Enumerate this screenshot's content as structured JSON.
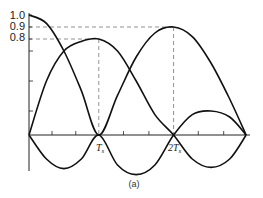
{
  "chart_data": {
    "type": "line",
    "title": "",
    "caption": "(a)",
    "xlabel": "",
    "ylabel": "",
    "xlim": [
      0,
      2.97
    ],
    "ylim": [
      -0.35,
      1.0
    ],
    "y_tick_labels": [
      {
        "value": 1.0,
        "label": "1.0"
      },
      {
        "value": 0.9,
        "label": "0.9"
      },
      {
        "value": 0.8,
        "label": "0.8"
      }
    ],
    "y_minor_ticks": [
      0.7,
      0.45,
      0.2
    ],
    "x_tick_labels": [
      {
        "value": 1,
        "label": "T",
        "sub": "s"
      },
      {
        "value": 2,
        "label": "2T",
        "sub": "s"
      }
    ],
    "x_minor_ticks": [
      0.33,
      0.67,
      1.33,
      1.67,
      2.33,
      2.67,
      2.95
    ],
    "reference_lines": [
      {
        "y": 0.9,
        "x_end": 2
      },
      {
        "y": 0.8,
        "x_end": 1
      }
    ],
    "series": [
      {
        "name": "curve-1",
        "points": [
          [
            0,
            1.0
          ],
          [
            0.25,
            0.93
          ],
          [
            0.5,
            0.7
          ],
          [
            0.75,
            0.37
          ],
          [
            1,
            0
          ],
          [
            1.25,
            0.33
          ],
          [
            1.5,
            0.65
          ],
          [
            1.75,
            0.85
          ],
          [
            2,
            0.9
          ],
          [
            2.25,
            0.82
          ],
          [
            2.5,
            0.6
          ],
          [
            2.75,
            0.3
          ],
          [
            2.97,
            0
          ]
        ]
      },
      {
        "name": "curve-2",
        "points": [
          [
            0,
            0
          ],
          [
            0.25,
            0.45
          ],
          [
            0.5,
            0.7
          ],
          [
            0.75,
            0.78
          ],
          [
            1,
            0.8
          ],
          [
            1.25,
            0.7
          ],
          [
            1.5,
            0.45
          ],
          [
            1.75,
            0.17
          ],
          [
            2,
            0
          ],
          [
            2.25,
            -0.2
          ],
          [
            2.5,
            -0.27
          ],
          [
            2.75,
            -0.2
          ],
          [
            2.97,
            0
          ]
        ]
      },
      {
        "name": "curve-3",
        "points": [
          [
            0,
            0
          ],
          [
            0.25,
            -0.2
          ],
          [
            0.5,
            -0.28
          ],
          [
            0.75,
            -0.2
          ],
          [
            1,
            0
          ],
          [
            1.25,
            -0.25
          ],
          [
            1.5,
            -0.33
          ],
          [
            1.75,
            -0.25
          ],
          [
            2,
            0
          ],
          [
            2.25,
            0.17
          ],
          [
            2.5,
            0.2
          ],
          [
            2.75,
            0.15
          ],
          [
            2.97,
            0
          ]
        ]
      }
    ]
  }
}
